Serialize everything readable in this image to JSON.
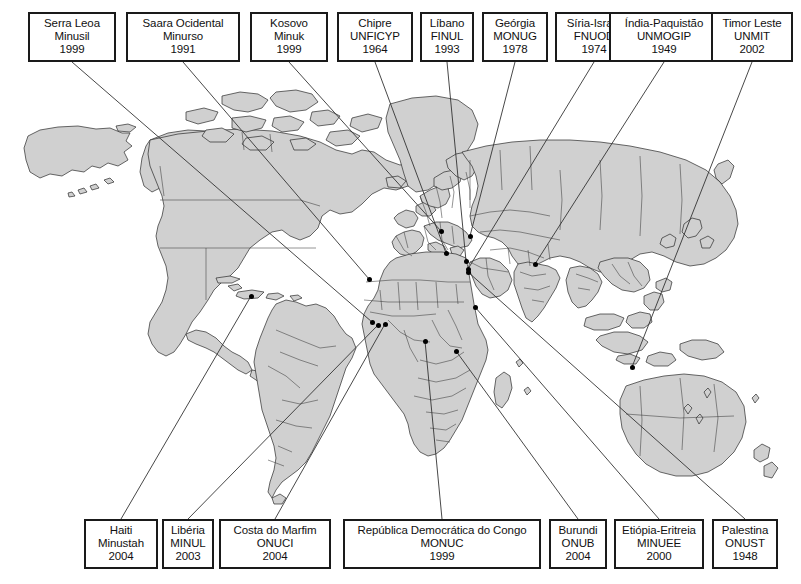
{
  "figure": {
    "kind": "world-map-with-callout-labels",
    "land_color": "#d0d0d0",
    "outline_color": "#2a2a2a",
    "marker_color": "#000000",
    "background_color": "#ffffff"
  },
  "top_labels": [
    {
      "name": "Serra Leoa",
      "mission": "Minusil",
      "year": "1999",
      "x": 28,
      "y": 12,
      "w": 88,
      "h": 50,
      "anchor_x": 72,
      "anchor_y": 62,
      "dot_x": 372,
      "dot_y": 322
    },
    {
      "name": "Saara Ocidental",
      "mission": "Minurso",
      "year": "1991",
      "x": 126,
      "y": 12,
      "w": 114,
      "h": 50,
      "anchor_x": 183,
      "anchor_y": 62,
      "dot_x": 369,
      "dot_y": 279
    },
    {
      "name": "Kosovo",
      "mission": "Minuk",
      "year": "1999",
      "x": 250,
      "y": 12,
      "w": 78,
      "h": 50,
      "anchor_x": 289,
      "anchor_y": 62,
      "dot_x": 441,
      "dot_y": 231
    },
    {
      "name": "Chipre",
      "mission": "UNFICYP",
      "year": "1964",
      "x": 337,
      "y": 12,
      "w": 76,
      "h": 50,
      "anchor_x": 375,
      "anchor_y": 62,
      "dot_x": 446,
      "dot_y": 253
    },
    {
      "name": "Líbano",
      "mission": "FINUL",
      "year": "1993",
      "x": 420,
      "y": 12,
      "w": 54,
      "h": 50,
      "anchor_x": 447,
      "anchor_y": 62,
      "dot_x": 466,
      "dot_y": 261
    },
    {
      "name": "Geórgia",
      "mission": "MONUG",
      "year": "1978",
      "x": 482,
      "y": 12,
      "w": 66,
      "h": 50,
      "anchor_x": 515,
      "anchor_y": 62,
      "dot_x": 470,
      "dot_y": 236
    },
    {
      "name": "Síria-Israel",
      "mission": "FNUOD",
      "year": "1974",
      "x": 555,
      "y": 12,
      "w": 78,
      "h": 50,
      "anchor_x": 594,
      "anchor_y": 62,
      "dot_x": 468,
      "dot_y": 269
    },
    {
      "name": "Índia-Paquistão",
      "mission": "UNMOGIP",
      "year": "1949",
      "x": 609,
      "y": 12,
      "w": 110,
      "h": 50,
      "anchor_x": 664,
      "anchor_y": 62,
      "dot_x": 535,
      "dot_y": 264
    },
    {
      "name": "Timor Leste",
      "mission": "UNMIT",
      "year": "2002",
      "x": 711,
      "y": 12,
      "w": 82,
      "h": 50,
      "anchor_x": 752,
      "anchor_y": 62,
      "dot_x": 632,
      "dot_y": 367
    }
  ],
  "bottom_labels": [
    {
      "name": "Haiti",
      "mission": "Minustah",
      "year": "2004",
      "x": 84,
      "y": 519,
      "w": 74,
      "h": 50,
      "anchor_x": 121,
      "anchor_y": 519,
      "dot_x": 251,
      "dot_y": 296
    },
    {
      "name": "Libéria",
      "mission": "MINUL",
      "year": "2003",
      "x": 162,
      "y": 519,
      "w": 52,
      "h": 50,
      "anchor_x": 188,
      "anchor_y": 519,
      "dot_x": 378,
      "dot_y": 325
    },
    {
      "name": "Costa do Marfim",
      "mission": "ONUCI",
      "year": "2004",
      "x": 219,
      "y": 519,
      "w": 112,
      "h": 50,
      "anchor_x": 275,
      "anchor_y": 519,
      "dot_x": 385,
      "dot_y": 324
    },
    {
      "name": "República Democrática do Congo",
      "mission": "MONUC",
      "year": "1999",
      "x": 343,
      "y": 519,
      "w": 198,
      "h": 50,
      "anchor_x": 442,
      "anchor_y": 519,
      "dot_x": 425,
      "dot_y": 341
    },
    {
      "name": "Burundi",
      "mission": "ONUB",
      "year": "2004",
      "x": 549,
      "y": 519,
      "w": 58,
      "h": 50,
      "anchor_x": 578,
      "anchor_y": 519,
      "dot_x": 456,
      "dot_y": 351
    },
    {
      "name": "Etiópia-Eritreia",
      "mission": "MINUEE",
      "year": "2000",
      "x": 614,
      "y": 519,
      "w": 90,
      "h": 50,
      "anchor_x": 659,
      "anchor_y": 519,
      "dot_x": 475,
      "dot_y": 307
    },
    {
      "name": "Palestina",
      "mission": "ONUST",
      "year": "1948",
      "x": 712,
      "y": 519,
      "w": 66,
      "h": 50,
      "anchor_x": 745,
      "anchor_y": 519,
      "dot_x": 468,
      "dot_y": 272
    }
  ],
  "markers": [
    {
      "label": "Haiti",
      "x": 251,
      "y": 296
    },
    {
      "label": "Saara Ocidental",
      "x": 369,
      "y": 279
    },
    {
      "label": "Serra Leoa",
      "x": 372,
      "y": 322
    },
    {
      "label": "Libéria",
      "x": 378,
      "y": 325
    },
    {
      "label": "Costa do Marfim",
      "x": 385,
      "y": 324
    },
    {
      "label": "Kosovo",
      "x": 441,
      "y": 231
    },
    {
      "label": "Chipre",
      "x": 446,
      "y": 253
    },
    {
      "label": "Líbano",
      "x": 466,
      "y": 261
    },
    {
      "label": "Palestina",
      "x": 468,
      "y": 272
    },
    {
      "label": "Síria-Israel",
      "x": 468,
      "y": 269
    },
    {
      "label": "Geórgia",
      "x": 470,
      "y": 236
    },
    {
      "label": "Etiópia-Eritreia",
      "x": 475,
      "y": 307
    },
    {
      "label": "Índia-Paquistão",
      "x": 535,
      "y": 264
    },
    {
      "label": "RD Congo",
      "x": 425,
      "y": 341
    },
    {
      "label": "Burundi",
      "x": 456,
      "y": 351
    },
    {
      "label": "Timor Leste",
      "x": 632,
      "y": 367
    }
  ]
}
